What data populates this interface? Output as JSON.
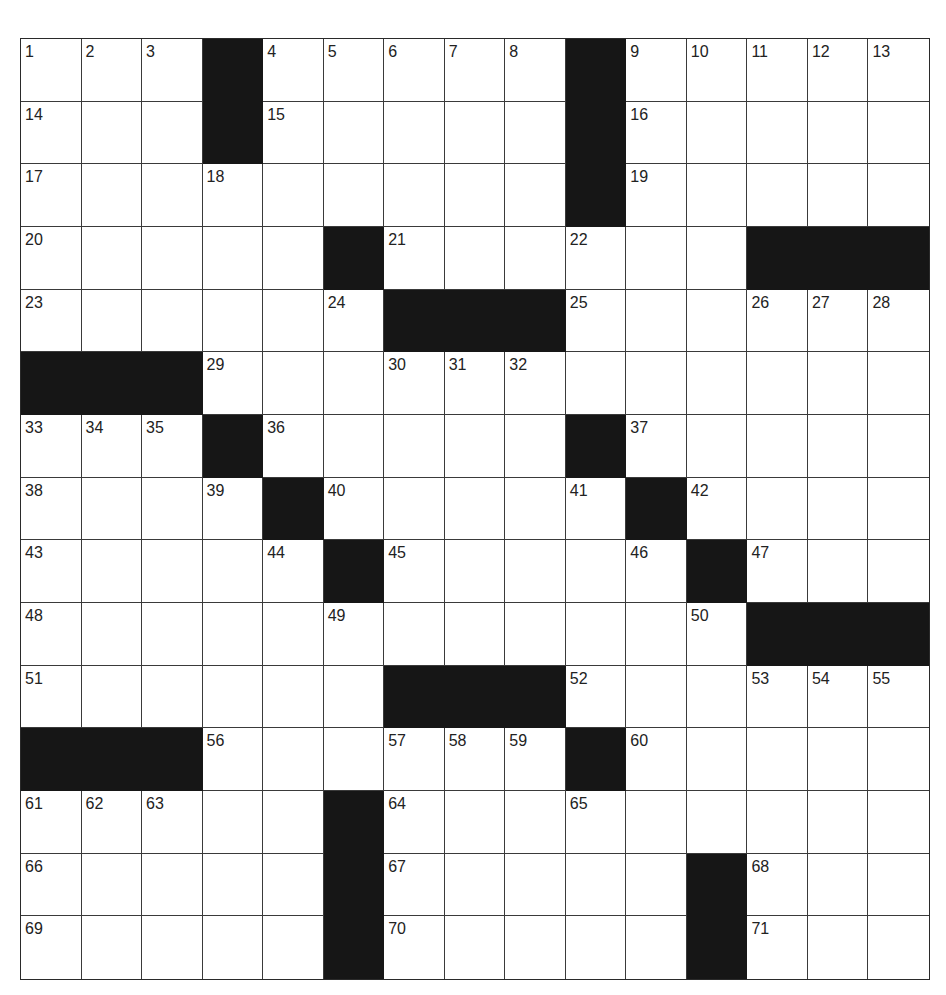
{
  "puzzle": {
    "rows": 15,
    "cols": 15,
    "grid": [
      [
        "1",
        "2",
        "3",
        "#",
        "4",
        "5",
        "6",
        "7",
        "8",
        "#",
        "9",
        "10",
        "11",
        "12",
        "13"
      ],
      [
        "14",
        "",
        "",
        "#",
        "15",
        "",
        "",
        "",
        "",
        "#",
        "16",
        "",
        "",
        "",
        ""
      ],
      [
        "17",
        "",
        "",
        "18",
        "",
        "",
        "",
        "",
        "",
        "#",
        "19",
        "",
        "",
        "",
        ""
      ],
      [
        "20",
        "",
        "",
        "",
        "",
        "#",
        "21",
        "",
        "",
        "22",
        "",
        "",
        "#",
        "#",
        "#"
      ],
      [
        "23",
        "",
        "",
        "",
        "",
        "24",
        "#",
        "#",
        "#",
        "25",
        "",
        "",
        "26",
        "27",
        "28"
      ],
      [
        "#",
        "#",
        "#",
        "29",
        "",
        "",
        "30",
        "31",
        "32",
        "",
        "",
        "",
        "",
        "",
        ""
      ],
      [
        "33",
        "34",
        "35",
        "#",
        "36",
        "",
        "",
        "",
        "",
        "#",
        "37",
        "",
        "",
        "",
        ""
      ],
      [
        "38",
        "",
        "",
        "39",
        "#",
        "40",
        "",
        "",
        "",
        "41",
        "#",
        "42",
        "",
        "",
        ""
      ],
      [
        "43",
        "",
        "",
        "",
        "44",
        "#",
        "45",
        "",
        "",
        "",
        "46",
        "#",
        "47",
        "",
        ""
      ],
      [
        "48",
        "",
        "",
        "",
        "",
        "49",
        "",
        "",
        "",
        "",
        "",
        "50",
        "#",
        "#",
        "#"
      ],
      [
        "51",
        "",
        "",
        "",
        "",
        "",
        "#",
        "#",
        "#",
        "52",
        "",
        "",
        "53",
        "54",
        "55"
      ],
      [
        "#",
        "#",
        "#",
        "56",
        "",
        "",
        "57",
        "58",
        "59",
        "#",
        "60",
        "",
        "",
        "",
        ""
      ],
      [
        "61",
        "62",
        "63",
        "",
        "",
        "#",
        "64",
        "",
        "",
        "65",
        "",
        "",
        "",
        "",
        ""
      ],
      [
        "66",
        "",
        "",
        "",
        "",
        "#",
        "67",
        "",
        "",
        "",
        "",
        "#",
        "68",
        "",
        ""
      ],
      [
        "69",
        "",
        "",
        "",
        "",
        "#",
        "70",
        "",
        "",
        "",
        "",
        "#",
        "71",
        "",
        ""
      ]
    ],
    "colors": {
      "block": "#161616",
      "line": "#3a3a3a",
      "cell": "#ffffff",
      "number": "#222222"
    }
  }
}
